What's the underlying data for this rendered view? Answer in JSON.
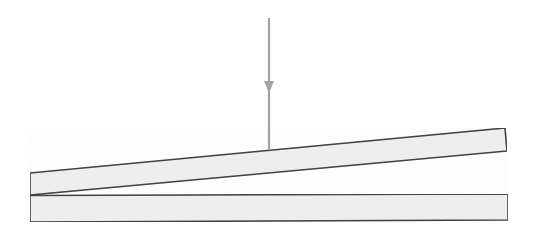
{
  "figure": {
    "canvas": {
      "width": 537,
      "height": 241,
      "background": "#ffffff"
    },
    "style": {
      "plank_fill": "#efefef",
      "plank_stroke": "#3c3c3c",
      "plank_stroke_width": 1.6,
      "arrow_color": "#a3a3a3",
      "arrow_stroke_width": 2.2
    },
    "elements": {
      "tilted_plank": {
        "label": "tilted plank",
        "points": "30,173 505,128 507,151 30,195",
        "fill": "#efefef",
        "stroke": "#3c3c3c"
      },
      "base_plank": {
        "label": "base plank",
        "points": "30,195.5 508,194 508,220 30,222",
        "fill": "#efefef",
        "stroke": "#3c3c3c"
      },
      "load_arrow": {
        "label": "downward load arrow",
        "x": 269,
        "y_start": 18,
        "y_end": 150,
        "head_top_y": 81,
        "head_tip_y": 93,
        "head_half_width": 5,
        "color": "#a3a3a3"
      }
    }
  }
}
